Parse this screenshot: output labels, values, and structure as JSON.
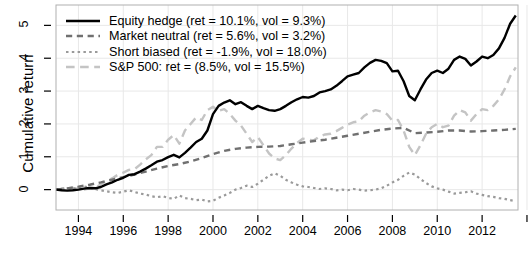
{
  "chart_data": {
    "type": "line",
    "title": "",
    "xlabel": "",
    "ylabel": "Cumulative return",
    "xlim": [
      1993.0,
      2013.6
    ],
    "ylim": [
      -0.62,
      5.62
    ],
    "xticks": [
      1994,
      1996,
      1998,
      2000,
      2002,
      2004,
      2006,
      2008,
      2010,
      2012,
      2014
    ],
    "xtick_labels": [
      "1994",
      "1996",
      "1998",
      "2000",
      "2002",
      "2004",
      "2006",
      "2008",
      "2010",
      "2012",
      ""
    ],
    "yticks": [
      0,
      1,
      2,
      3,
      4,
      5
    ],
    "ytick_labels": [
      "0",
      "1",
      "2",
      "3",
      "4",
      "5"
    ],
    "grid": true,
    "grid_color": "#e8e8e8",
    "frame": true,
    "legend_position": "top-left",
    "series": [
      {
        "name": "Equity hedge",
        "legend_label": "Equity hedge (ret = 10.1%, vol = 9.3%)",
        "ret": "10.1%",
        "vol": "9.3%",
        "color": "#000000",
        "style": "solid",
        "width": 2.4,
        "x": [
          1993.0,
          1993.25,
          1993.5,
          1993.75,
          1994.0,
          1994.25,
          1994.5,
          1994.75,
          1995.0,
          1995.25,
          1995.5,
          1995.75,
          1996.0,
          1996.25,
          1996.5,
          1996.75,
          1997.0,
          1997.25,
          1997.5,
          1997.75,
          1998.0,
          1998.25,
          1998.5,
          1998.75,
          1999.0,
          1999.25,
          1999.5,
          1999.75,
          2000.0,
          2000.25,
          2000.5,
          2000.75,
          2001.0,
          2001.25,
          2001.5,
          2001.75,
          2002.0,
          2002.25,
          2002.5,
          2002.75,
          2003.0,
          2003.25,
          2003.5,
          2003.75,
          2004.0,
          2004.25,
          2004.5,
          2004.75,
          2005.0,
          2005.25,
          2005.5,
          2005.75,
          2006.0,
          2006.25,
          2006.5,
          2006.75,
          2007.0,
          2007.25,
          2007.5,
          2007.75,
          2008.0,
          2008.25,
          2008.5,
          2008.75,
          2009.0,
          2009.25,
          2009.5,
          2009.75,
          2010.0,
          2010.25,
          2010.5,
          2010.75,
          2011.0,
          2011.25,
          2011.5,
          2011.75,
          2012.0,
          2012.25,
          2012.5,
          2012.75,
          2013.0,
          2013.25,
          2013.5
        ],
        "y": [
          0.0,
          -0.02,
          -0.03,
          -0.02,
          0.0,
          0.03,
          0.05,
          0.04,
          0.08,
          0.16,
          0.22,
          0.3,
          0.36,
          0.45,
          0.47,
          0.55,
          0.64,
          0.74,
          0.85,
          0.9,
          0.99,
          1.06,
          0.98,
          1.12,
          1.28,
          1.45,
          1.55,
          1.8,
          2.3,
          2.55,
          2.65,
          2.72,
          2.6,
          2.66,
          2.55,
          2.45,
          2.55,
          2.48,
          2.42,
          2.4,
          2.45,
          2.55,
          2.66,
          2.75,
          2.82,
          2.8,
          2.85,
          2.96,
          3.0,
          3.05,
          3.16,
          3.3,
          3.45,
          3.5,
          3.55,
          3.72,
          3.86,
          3.95,
          3.92,
          3.85,
          3.6,
          3.62,
          3.3,
          2.85,
          2.72,
          3.05,
          3.35,
          3.55,
          3.62,
          3.55,
          3.68,
          3.95,
          4.05,
          3.98,
          3.78,
          3.9,
          4.05,
          4.0,
          4.1,
          4.3,
          4.62,
          5.05,
          5.3
        ]
      },
      {
        "name": "Market neutral",
        "legend_label": "Market neutral (ret = 5.6%, vol = 3.2%)",
        "ret": "5.6%",
        "vol": "3.2%",
        "color": "#707070",
        "style": "dashed",
        "width": 2.4,
        "x": [
          1993.0,
          1993.5,
          1994.0,
          1994.5,
          1995.0,
          1995.5,
          1996.0,
          1996.5,
          1997.0,
          1997.5,
          1998.0,
          1998.5,
          1999.0,
          1999.5,
          2000.0,
          2000.5,
          2001.0,
          2001.5,
          2002.0,
          2002.5,
          2003.0,
          2003.5,
          2004.0,
          2004.5,
          2005.0,
          2005.5,
          2006.0,
          2006.5,
          2007.0,
          2007.5,
          2008.0,
          2008.5,
          2009.0,
          2009.5,
          2010.0,
          2010.5,
          2011.0,
          2011.5,
          2012.0,
          2012.5,
          2013.0,
          2013.5
        ],
        "y": [
          0.0,
          0.04,
          0.09,
          0.15,
          0.22,
          0.3,
          0.38,
          0.46,
          0.55,
          0.64,
          0.72,
          0.78,
          0.86,
          0.96,
          1.08,
          1.18,
          1.24,
          1.28,
          1.3,
          1.31,
          1.33,
          1.38,
          1.43,
          1.48,
          1.52,
          1.58,
          1.64,
          1.7,
          1.76,
          1.82,
          1.86,
          1.88,
          1.72,
          1.74,
          1.76,
          1.8,
          1.8,
          1.77,
          1.78,
          1.8,
          1.82,
          1.85
        ]
      },
      {
        "name": "Short biased",
        "legend_label": "Short biased (ret = -1.9%, vol = 18.0%)",
        "ret": "-1.9%",
        "vol": "18.0%",
        "color": "#9a9a9a",
        "style": "dotted",
        "width": 2.2,
        "x": [
          1993.0,
          1993.25,
          1993.5,
          1993.75,
          1994.0,
          1994.25,
          1994.5,
          1994.75,
          1995.0,
          1995.25,
          1995.5,
          1995.75,
          1996.0,
          1996.25,
          1996.5,
          1996.75,
          1997.0,
          1997.25,
          1997.5,
          1997.75,
          1998.0,
          1998.25,
          1998.5,
          1998.75,
          1999.0,
          1999.25,
          1999.5,
          1999.75,
          2000.0,
          2000.25,
          2000.5,
          2000.75,
          2001.0,
          2001.25,
          2001.5,
          2001.75,
          2002.0,
          2002.25,
          2002.5,
          2002.75,
          2003.0,
          2003.25,
          2003.5,
          2003.75,
          2004.0,
          2004.25,
          2004.5,
          2004.75,
          2005.0,
          2005.25,
          2005.5,
          2005.75,
          2006.0,
          2006.25,
          2006.5,
          2006.75,
          2007.0,
          2007.25,
          2007.5,
          2007.75,
          2008.0,
          2008.25,
          2008.5,
          2008.75,
          2009.0,
          2009.25,
          2009.5,
          2009.75,
          2010.0,
          2010.25,
          2010.5,
          2010.75,
          2011.0,
          2011.25,
          2011.5,
          2011.75,
          2012.0,
          2012.25,
          2012.5,
          2012.75,
          2013.0,
          2013.25,
          2013.5
        ],
        "y": [
          0.0,
          0.03,
          0.05,
          0.02,
          0.06,
          0.1,
          0.06,
          0.02,
          -0.02,
          -0.05,
          -0.08,
          -0.1,
          -0.06,
          -0.02,
          -0.07,
          -0.12,
          -0.15,
          -0.2,
          -0.23,
          -0.2,
          -0.25,
          -0.28,
          -0.18,
          -0.26,
          -0.28,
          -0.32,
          -0.3,
          -0.36,
          -0.34,
          -0.25,
          -0.18,
          -0.1,
          0.0,
          0.05,
          0.12,
          0.08,
          0.18,
          0.3,
          0.42,
          0.5,
          0.42,
          0.3,
          0.22,
          0.15,
          0.1,
          0.08,
          0.05,
          0.02,
          0.04,
          0.02,
          -0.02,
          0.0,
          -0.02,
          0.02,
          0.0,
          -0.03,
          -0.02,
          0.0,
          0.04,
          0.12,
          0.22,
          0.3,
          0.42,
          0.52,
          0.46,
          0.32,
          0.2,
          0.1,
          0.04,
          0.0,
          -0.06,
          -0.12,
          -0.1,
          -0.08,
          -0.05,
          -0.12,
          -0.16,
          -0.2,
          -0.22,
          -0.26,
          -0.28,
          -0.32,
          -0.35
        ]
      },
      {
        "name": "S&P 500",
        "legend_label": "S&P 500: ret = (8.5%, vol = 15.5%)",
        "ret": "8.5%",
        "vol": "15.5%",
        "color": "#c4c4c4",
        "style": "longdash",
        "width": 2.4,
        "x": [
          1993.0,
          1993.25,
          1993.5,
          1993.75,
          1994.0,
          1994.25,
          1994.5,
          1994.75,
          1995.0,
          1995.25,
          1995.5,
          1995.75,
          1996.0,
          1996.25,
          1996.5,
          1996.75,
          1997.0,
          1997.25,
          1997.5,
          1997.75,
          1998.0,
          1998.25,
          1998.5,
          1998.75,
          1999.0,
          1999.25,
          1999.5,
          1999.75,
          2000.0,
          2000.25,
          2000.5,
          2000.75,
          2001.0,
          2001.25,
          2001.5,
          2001.75,
          2002.0,
          2002.25,
          2002.5,
          2002.75,
          2003.0,
          2003.25,
          2003.5,
          2003.75,
          2004.0,
          2004.25,
          2004.5,
          2004.75,
          2005.0,
          2005.25,
          2005.5,
          2005.75,
          2006.0,
          2006.25,
          2006.5,
          2006.75,
          2007.0,
          2007.25,
          2007.5,
          2007.75,
          2008.0,
          2008.25,
          2008.5,
          2008.75,
          2009.0,
          2009.25,
          2009.5,
          2009.75,
          2010.0,
          2010.25,
          2010.5,
          2010.75,
          2011.0,
          2011.25,
          2011.5,
          2011.75,
          2012.0,
          2012.25,
          2012.5,
          2012.75,
          2013.0,
          2013.25,
          2013.5
        ],
        "y": [
          0.0,
          0.02,
          0.04,
          0.05,
          0.02,
          0.0,
          0.04,
          0.06,
          0.16,
          0.26,
          0.34,
          0.45,
          0.52,
          0.6,
          0.62,
          0.76,
          0.92,
          1.05,
          1.3,
          1.3,
          1.52,
          1.66,
          1.4,
          1.8,
          2.0,
          2.2,
          2.12,
          2.42,
          2.52,
          2.4,
          2.45,
          2.3,
          2.1,
          1.95,
          1.7,
          1.45,
          1.6,
          1.35,
          1.1,
          0.95,
          0.9,
          1.05,
          1.25,
          1.42,
          1.55,
          1.52,
          1.5,
          1.62,
          1.68,
          1.7,
          1.78,
          1.88,
          1.98,
          2.05,
          2.08,
          2.25,
          2.35,
          2.42,
          2.38,
          2.3,
          2.1,
          2.12,
          1.8,
          1.3,
          1.05,
          1.35,
          1.7,
          1.9,
          2.0,
          1.9,
          1.95,
          2.25,
          2.42,
          2.35,
          2.1,
          2.3,
          2.45,
          2.42,
          2.55,
          2.75,
          3.05,
          3.45,
          3.72
        ]
      }
    ]
  },
  "legend": {
    "entries": [
      {
        "label": "Equity hedge (ret = 10.1%, vol = 9.3%)"
      },
      {
        "label": "Market neutral (ret = 5.6%, vol = 3.2%)"
      },
      {
        "label": "Short biased (ret = -1.9%, vol = 18.0%)"
      },
      {
        "label": "S&P 500: ret = (8.5%, vol = 15.5%)"
      }
    ]
  }
}
